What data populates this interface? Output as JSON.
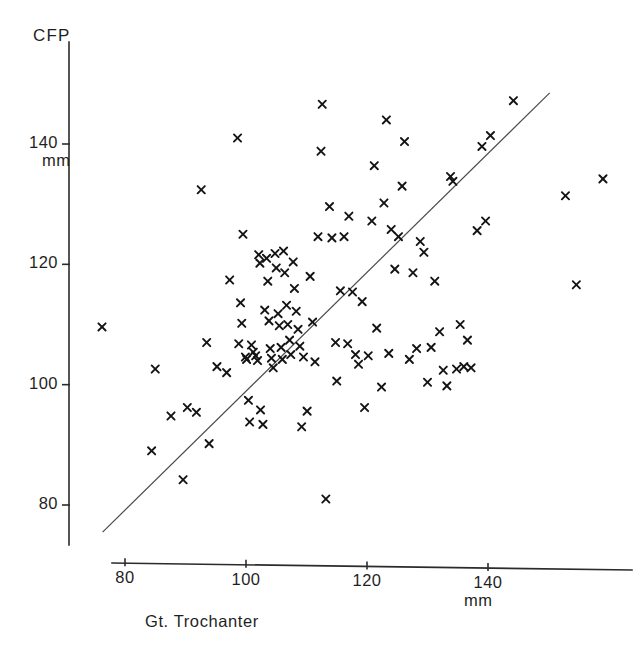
{
  "figure": {
    "background": "#ffffff",
    "ink_color": "#141414",
    "line_color": "#4a4a4a"
  },
  "axes": {
    "y_title": "CFP",
    "y_unit": "mm",
    "x_title": "Gt. Trochanter",
    "x_unit": "mm"
  },
  "chart_data": {
    "type": "scatter",
    "title": "",
    "xlabel": "Gt. Trochanter",
    "ylabel": "CFP",
    "x_unit": "mm",
    "y_unit": "mm",
    "grid": false,
    "legend": "none",
    "marker": "x",
    "xlim": [
      76,
      162
    ],
    "ylim": [
      74,
      152
    ],
    "xticks": [
      80,
      100,
      120,
      140
    ],
    "ytick_labels": [
      "80",
      "100",
      "120",
      "140"
    ],
    "yticks": [
      80,
      100,
      120,
      140
    ],
    "xtick_labels": [
      "80",
      "100",
      "120",
      "140"
    ],
    "trend_line": {
      "label": "identity/regression line",
      "x0": 76.3,
      "y0": 75.5,
      "x1": 150.2,
      "y1": 148.5
    },
    "points": [
      [
        76.2,
        109.6
      ],
      [
        84.4,
        89.0
      ],
      [
        85.0,
        102.6
      ],
      [
        87.6,
        94.8
      ],
      [
        89.6,
        84.2
      ],
      [
        90.3,
        96.2
      ],
      [
        91.8,
        95.4
      ],
      [
        92.6,
        132.4
      ],
      [
        93.5,
        107.0
      ],
      [
        93.9,
        90.2
      ],
      [
        95.2,
        103.0
      ],
      [
        96.8,
        102.0
      ],
      [
        97.3,
        117.4
      ],
      [
        98.6,
        141.0
      ],
      [
        98.8,
        106.8
      ],
      [
        99.1,
        113.6
      ],
      [
        99.3,
        110.2
      ],
      [
        99.5,
        125.0
      ],
      [
        99.9,
        104.6
      ],
      [
        100.1,
        104.2
      ],
      [
        100.4,
        97.4
      ],
      [
        100.6,
        93.8
      ],
      [
        100.9,
        106.6
      ],
      [
        101.2,
        105.4
      ],
      [
        101.6,
        104.8
      ],
      [
        101.9,
        104.0
      ],
      [
        102.1,
        121.6
      ],
      [
        102.3,
        120.2
      ],
      [
        102.4,
        95.8
      ],
      [
        102.8,
        93.4
      ],
      [
        103.1,
        112.4
      ],
      [
        103.4,
        121.0
      ],
      [
        103.6,
        117.2
      ],
      [
        103.8,
        110.6
      ],
      [
        104.0,
        106.0
      ],
      [
        104.2,
        104.4
      ],
      [
        104.5,
        102.8
      ],
      [
        104.8,
        121.8
      ],
      [
        105.0,
        119.4
      ],
      [
        105.3,
        111.8
      ],
      [
        105.5,
        109.8
      ],
      [
        105.8,
        106.2
      ],
      [
        106.0,
        104.2
      ],
      [
        106.2,
        122.2
      ],
      [
        106.4,
        118.6
      ],
      [
        106.7,
        113.2
      ],
      [
        106.9,
        110.0
      ],
      [
        107.2,
        107.4
      ],
      [
        107.4,
        105.0
      ],
      [
        107.8,
        120.4
      ],
      [
        108.0,
        116.0
      ],
      [
        108.3,
        112.2
      ],
      [
        108.6,
        109.2
      ],
      [
        108.9,
        106.4
      ],
      [
        109.2,
        93.0
      ],
      [
        109.5,
        104.6
      ],
      [
        110.1,
        95.6
      ],
      [
        110.6,
        118.0
      ],
      [
        111.0,
        110.4
      ],
      [
        111.4,
        103.8
      ],
      [
        111.9,
        124.6
      ],
      [
        112.4,
        138.8
      ],
      [
        112.6,
        146.6
      ],
      [
        113.2,
        81.0
      ],
      [
        113.8,
        129.6
      ],
      [
        114.2,
        124.4
      ],
      [
        114.8,
        107.0
      ],
      [
        115.0,
        100.6
      ],
      [
        115.6,
        115.6
      ],
      [
        116.2,
        124.6
      ],
      [
        116.8,
        106.8
      ],
      [
        117.0,
        128.0
      ],
      [
        117.6,
        115.4
      ],
      [
        118.1,
        105.0
      ],
      [
        118.6,
        103.4
      ],
      [
        119.2,
        113.8
      ],
      [
        119.6,
        96.2
      ],
      [
        120.2,
        104.8
      ],
      [
        120.8,
        127.2
      ],
      [
        121.2,
        136.4
      ],
      [
        121.6,
        109.4
      ],
      [
        122.4,
        99.6
      ],
      [
        122.8,
        130.2
      ],
      [
        123.2,
        144.0
      ],
      [
        123.6,
        105.2
      ],
      [
        124.0,
        125.8
      ],
      [
        124.6,
        119.2
      ],
      [
        125.2,
        124.6
      ],
      [
        125.8,
        133.0
      ],
      [
        126.2,
        140.4
      ],
      [
        127.0,
        104.2
      ],
      [
        127.6,
        118.6
      ],
      [
        128.2,
        106.0
      ],
      [
        128.8,
        123.8
      ],
      [
        129.4,
        122.0
      ],
      [
        130.0,
        100.4
      ],
      [
        130.6,
        106.2
      ],
      [
        131.2,
        117.2
      ],
      [
        132.0,
        108.8
      ],
      [
        132.6,
        102.4
      ],
      [
        133.2,
        99.8
      ],
      [
        133.8,
        134.6
      ],
      [
        134.2,
        133.8
      ],
      [
        134.8,
        102.6
      ],
      [
        135.4,
        110.0
      ],
      [
        136.0,
        103.0
      ],
      [
        136.6,
        107.4
      ],
      [
        137.2,
        102.8
      ],
      [
        138.2,
        125.6
      ],
      [
        139.0,
        139.6
      ],
      [
        139.6,
        127.2
      ],
      [
        140.4,
        141.4
      ],
      [
        144.2,
        147.2
      ],
      [
        152.8,
        131.4
      ],
      [
        154.6,
        116.6
      ],
      [
        159.0,
        134.2
      ]
    ]
  }
}
